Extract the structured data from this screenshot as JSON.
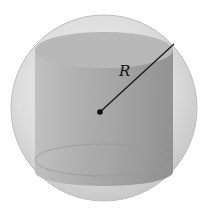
{
  "diagram": {
    "radius_label": "R",
    "colors": {
      "sphere": "#d9d9d9",
      "cylinder": "#9a9a9a",
      "line": "#111111"
    }
  }
}
